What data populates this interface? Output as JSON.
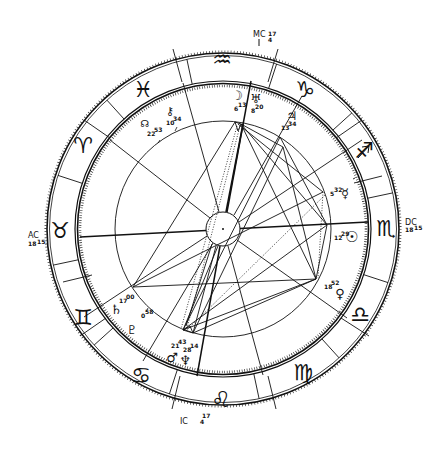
{
  "chart": {
    "type": "natal-horoscope-wheel",
    "center": [
      223,
      229
    ],
    "colors": {
      "ink": "#111111",
      "background": "#ffffff"
    },
    "angles": {
      "mc": {
        "label": "MC",
        "degree": "4",
        "minute": "17"
      },
      "ic": {
        "label": "IC",
        "degree": "4",
        "minute": "17"
      },
      "asc": {
        "label": "AC",
        "degree": "18",
        "minute": "15"
      },
      "dsc": {
        "label": "DC",
        "degree": "18",
        "minute": "15"
      }
    },
    "signs": [
      {
        "name": "aquarius",
        "glyph": "♒"
      },
      {
        "name": "capricorn",
        "glyph": "♑"
      },
      {
        "name": "sagittarius",
        "glyph": "♐"
      },
      {
        "name": "scorpio",
        "glyph": "♏"
      },
      {
        "name": "libra",
        "glyph": "♎"
      },
      {
        "name": "virgo",
        "glyph": "♍"
      },
      {
        "name": "leo",
        "glyph": "♌"
      },
      {
        "name": "cancer",
        "glyph": "♋"
      },
      {
        "name": "gemini",
        "glyph": "♊"
      },
      {
        "name": "taurus",
        "glyph": "♉"
      },
      {
        "name": "aries",
        "glyph": "♈"
      },
      {
        "name": "pisces",
        "glyph": "♓"
      }
    ],
    "planets": [
      {
        "name": "moon",
        "glyph": "☽",
        "degree": "6",
        "minute": "13"
      },
      {
        "name": "uranus",
        "glyph": "♅",
        "degree": "8",
        "minute": "20"
      },
      {
        "name": "jupiter",
        "glyph": "♃",
        "degree": "13",
        "minute": "34"
      },
      {
        "name": "mercury",
        "glyph": "☿",
        "degree": "5",
        "minute": "32"
      },
      {
        "name": "sun",
        "glyph": "☉",
        "degree": "12",
        "minute": "29"
      },
      {
        "name": "venus",
        "glyph": "♀",
        "degree": "18",
        "minute": "52"
      },
      {
        "name": "neptune",
        "glyph": "♆",
        "degree": "28",
        "minute": "14"
      },
      {
        "name": "mars",
        "glyph": "♂",
        "degree": "21",
        "minute": "43"
      },
      {
        "name": "pluto",
        "glyph": "♇",
        "degree": "",
        "minute": ""
      },
      {
        "name": "saturn",
        "glyph": "♄",
        "degree": "17",
        "minute": "00"
      },
      {
        "name": "node",
        "glyph": "☊",
        "degree": "22",
        "minute": "53"
      },
      {
        "name": "chiron",
        "glyph": "⚷",
        "degree": "10",
        "minute": "34"
      },
      {
        "name": "pluto-degree",
        "glyph": "",
        "degree": "0",
        "minute": "58"
      }
    ]
  }
}
